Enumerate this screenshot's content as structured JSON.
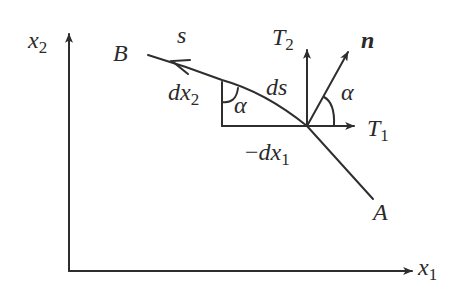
{
  "figure": {
    "axes": {
      "vertical_label": "x",
      "vertical_subscript": "2",
      "horizontal_label": "x",
      "horizontal_subscript": "1"
    },
    "points": {
      "start": "A",
      "end": "B"
    },
    "curve_label": "s",
    "element": {
      "arc_label": "ds",
      "vertical_leg_label": "dx",
      "vertical_leg_subscript": "2",
      "horizontal_leg_prefix": "−",
      "horizontal_leg_label": "dx",
      "horizontal_leg_subscript": "1",
      "angle_label": "α"
    },
    "vectors": {
      "normal": "n",
      "t2_label": "T",
      "t2_subscript": "2",
      "t1_label": "T",
      "t1_subscript": "1",
      "angle_label": "α"
    },
    "colors": {
      "stroke": "#2e2e2e",
      "background": "#ffffff"
    }
  }
}
